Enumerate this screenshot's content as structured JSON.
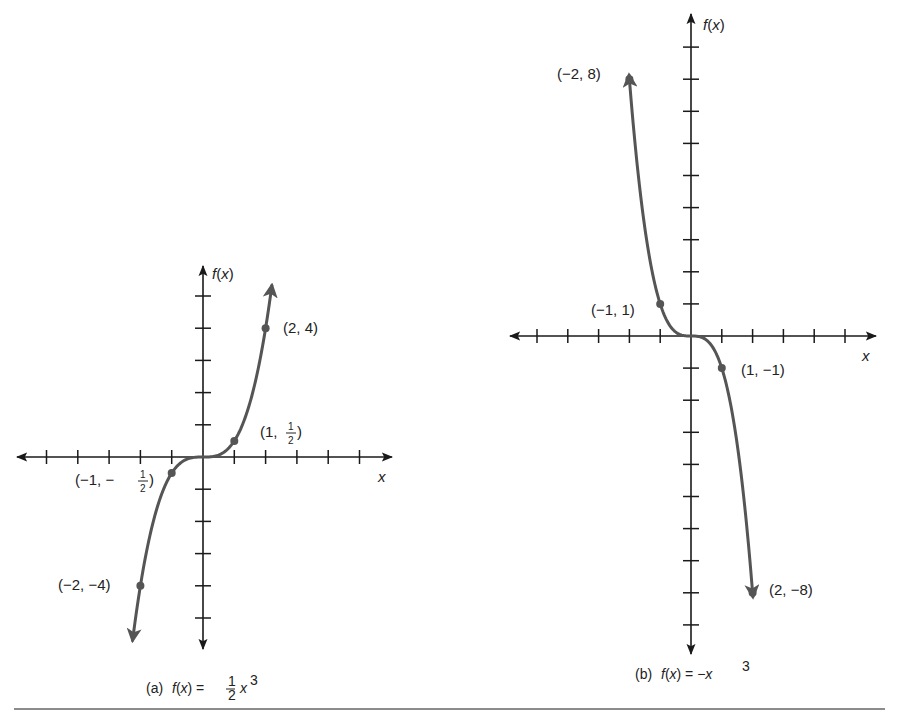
{
  "chart_data": [
    {
      "type": "line",
      "id": "a",
      "title": "(a)  f(x) = 1/2 x^3",
      "caption_prefix": "(a)",
      "caption_lhs": "f(x) =",
      "caption_frac_num": "1",
      "caption_frac_den": "2",
      "caption_var": "x",
      "caption_exp": "3",
      "xlabel": "x",
      "ylabel": "f(x)",
      "function": "0.5*x^3",
      "xlim": [
        -6,
        6
      ],
      "ylim": [
        -6,
        6
      ],
      "x_ticks": [
        -5,
        -4,
        -3,
        -2,
        -1,
        1,
        2,
        3,
        4,
        5
      ],
      "y_ticks": [
        -5,
        -4,
        -3,
        -2,
        -1,
        1,
        2,
        3,
        4,
        5
      ],
      "grid": false,
      "points": [
        {
          "x": -2,
          "y": -4,
          "label": "(−2, −4)"
        },
        {
          "x": -1,
          "y": -0.5,
          "label_main": "(−1, −",
          "label_num": "1",
          "label_den": "2",
          "label_end": ")"
        },
        {
          "x": 1,
          "y": 0.5,
          "label_main": "(1, ",
          "label_num": "1",
          "label_den": "2",
          "label_end": ")"
        },
        {
          "x": 2,
          "y": 4,
          "label": "(2, 4)"
        }
      ],
      "pixel": {
        "ox": 203,
        "oy": 457,
        "ux": 31.3,
        "uy": 32.2,
        "x_left": 17,
        "x_right": 392,
        "y_top": 266,
        "y_bottom": 649
      }
    },
    {
      "type": "line",
      "id": "b",
      "title": "(b)  f(x) = −x^3",
      "caption_prefix": "(b)",
      "caption_lhs": "f(x) = −x",
      "caption_exp": "3",
      "xlabel": "x",
      "ylabel": "f(x)",
      "function": "-x^3",
      "xlim": [
        -6,
        6
      ],
      "ylim": [
        -10,
        10
      ],
      "x_ticks": [
        -5,
        -4,
        -3,
        -2,
        -1,
        1,
        2,
        3,
        4,
        5
      ],
      "y_ticks": [
        -9,
        -8,
        -7,
        -6,
        -5,
        -4,
        -3,
        -2,
        -1,
        1,
        2,
        3,
        4,
        5,
        6,
        7,
        8,
        9
      ],
      "grid": false,
      "points": [
        {
          "x": -2,
          "y": 8,
          "label": "(−2, 8)"
        },
        {
          "x": -1,
          "y": 1,
          "label": "(−1, 1)"
        },
        {
          "x": 1,
          "y": -1,
          "label": "(1, −1)"
        },
        {
          "x": 2,
          "y": -8,
          "label": "(2, −8)"
        }
      ],
      "pixel": {
        "ox": 691,
        "oy": 336,
        "ux": 30.8,
        "uy": 32.1,
        "x_left": 510,
        "x_right": 876,
        "y_top": 14,
        "y_bottom": 654
      }
    }
  ],
  "colors": {
    "axis": "#1a1a1a",
    "curve": "#555555",
    "text": "#222222",
    "rule": "#666666"
  }
}
